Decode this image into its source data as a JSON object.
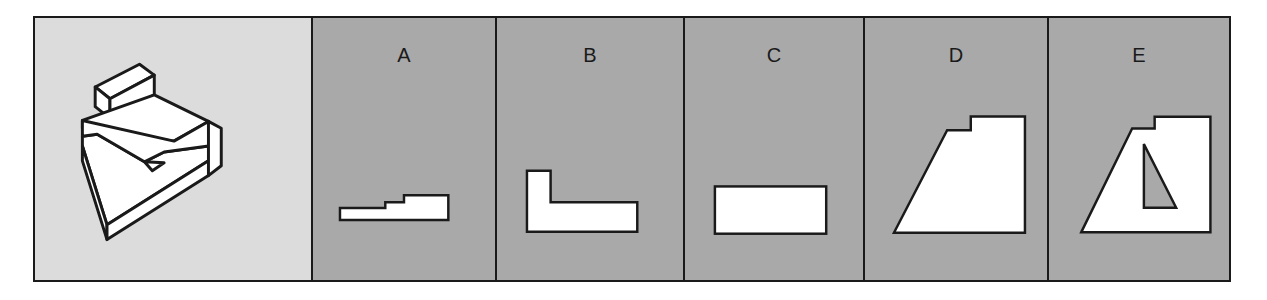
{
  "question": {
    "description": "Isometric view of a 3D block object"
  },
  "options": [
    {
      "label": "A",
      "shape": "stepped-profile"
    },
    {
      "label": "B",
      "shape": "L-profile"
    },
    {
      "label": "C",
      "shape": "rectangle"
    },
    {
      "label": "D",
      "shape": "trapezoid-with-step"
    },
    {
      "label": "E",
      "shape": "trapezoid-with-step-and-triangular-hole"
    }
  ],
  "colors": {
    "question_bg": "#dcdcdc",
    "option_bg": "#a9a9a9",
    "stroke": "#1a1a1a",
    "fill": "#ffffff"
  }
}
